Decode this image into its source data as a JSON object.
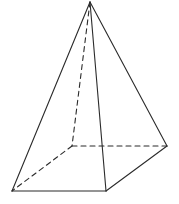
{
  "diagram": {
    "type": "square-pyramid",
    "stroke_color": "#2b2b2b",
    "background": "#ffffff",
    "vertices": {
      "apex": [
        90,
        2
      ],
      "base_back_left": [
        72,
        146
      ],
      "base_back_right": [
        167,
        146
      ],
      "base_front_left": [
        12,
        191
      ],
      "base_front_right": [
        106,
        191
      ]
    },
    "visible_edges": [
      [
        "apex",
        "base_front_left"
      ],
      [
        "apex",
        "base_front_right"
      ],
      [
        "apex",
        "base_back_right"
      ],
      [
        "base_front_left",
        "base_front_right"
      ],
      [
        "base_front_right",
        "base_back_right"
      ]
    ],
    "hidden_edges": [
      [
        "apex",
        "base_back_left"
      ],
      [
        "base_back_left",
        "base_back_right"
      ],
      [
        "base_back_left",
        "base_front_left"
      ]
    ]
  }
}
